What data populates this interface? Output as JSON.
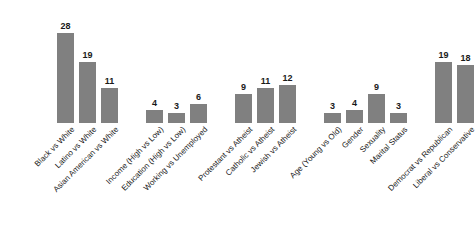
{
  "chart_data": {
    "type": "bar",
    "title": "",
    "subtitle": "",
    "xlabel": "",
    "ylabel": "",
    "ylim": [
      0,
      30
    ],
    "grid": false,
    "legend": "none",
    "bar_color": "#808080",
    "value_label_color": "#1a1a1a",
    "tick_label_rotation": -45,
    "categories": [
      "Black vs White",
      "Latino vs White",
      "Asian American vs White",
      "Income (High vs Low)",
      "Education (High vs Low)",
      "Working vs Unemployed",
      "Protestant vs Atheist",
      "Catholic vs Atheist",
      "Jewish vs Atheist",
      "Age (Young vs Old)",
      "Gender",
      "Sexuality",
      "Marital Status",
      "Democrat vs Republican",
      "Liberal vs Conservative"
    ],
    "values": [
      28,
      19,
      11,
      4,
      3,
      6,
      9,
      11,
      12,
      3,
      4,
      9,
      3,
      19,
      18
    ],
    "groups": [
      {
        "name": "race",
        "bars": [
          {
            "label": "Black vs White",
            "value": 28
          },
          {
            "label": "Latino vs White",
            "value": 19
          },
          {
            "label": "Asian American vs White",
            "value": 11
          }
        ]
      },
      {
        "name": "socioeconomic",
        "bars": [
          {
            "label": "Income (High vs Low)",
            "value": 4
          },
          {
            "label": "Education (High vs Low)",
            "value": 3
          },
          {
            "label": "Working vs Unemployed",
            "value": 6
          }
        ]
      },
      {
        "name": "religion",
        "bars": [
          {
            "label": "Protestant vs Atheist",
            "value": 9
          },
          {
            "label": "Catholic vs Atheist",
            "value": 11
          },
          {
            "label": "Jewish vs Atheist",
            "value": 12
          }
        ]
      },
      {
        "name": "demographic",
        "bars": [
          {
            "label": "Age (Young vs Old)",
            "value": 3
          },
          {
            "label": "Gender",
            "value": 4
          },
          {
            "label": "Sexuality",
            "value": 9
          },
          {
            "label": "Marital Status",
            "value": 3
          }
        ]
      },
      {
        "name": "political",
        "bars": [
          {
            "label": "Democrat vs Republican",
            "value": 19
          },
          {
            "label": "Liberal vs Conservative",
            "value": 18
          }
        ]
      }
    ]
  }
}
